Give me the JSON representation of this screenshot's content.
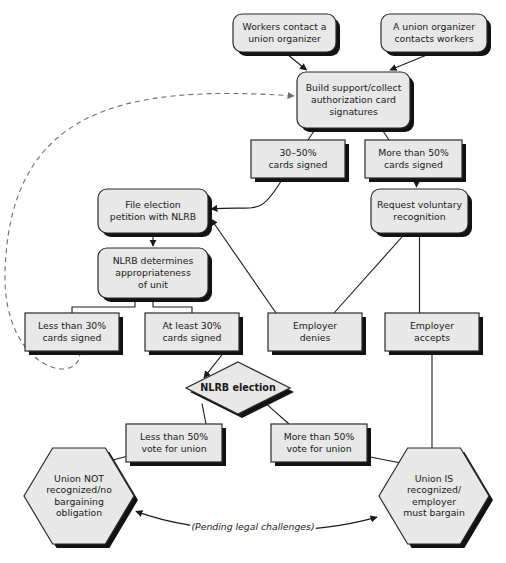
{
  "chart_data": {
    "type": "diagram",
    "title": "",
    "diagram_kind": "flowchart",
    "background": "#ffffff",
    "fill_color": "#e8e8e8",
    "stroke_color": "#2b2b2b",
    "shadow_color": "#121212",
    "nodes": [
      {
        "id": "n1",
        "label": "Workers contact a\nunion organizer",
        "shape": "rounded-rect",
        "x": 233,
        "y": 14,
        "w": 103,
        "h": 38
      },
      {
        "id": "n2",
        "label": "A union organizer\ncontacts workers",
        "shape": "rounded-rect",
        "x": 381,
        "y": 14,
        "w": 106,
        "h": 38
      },
      {
        "id": "n3",
        "label": "Build support/collect\nauthorization card\nsignatures",
        "shape": "rounded-rect",
        "x": 297,
        "y": 72,
        "w": 113,
        "h": 56
      },
      {
        "id": "n4",
        "label": "30–50%\ncards signed",
        "shape": "rect",
        "x": 251,
        "y": 140,
        "w": 94,
        "h": 38
      },
      {
        "id": "n5",
        "label": "More than 50%\ncards signed",
        "shape": "rect",
        "x": 365,
        "y": 140,
        "w": 97,
        "h": 38
      },
      {
        "id": "n6",
        "label": "Request voluntary\nrecognition",
        "shape": "rounded-rect",
        "x": 371,
        "y": 189,
        "w": 97,
        "h": 44
      },
      {
        "id": "n7",
        "label": "File election\npetition with NLRB",
        "shape": "rounded-rect",
        "x": 98,
        "y": 189,
        "w": 110,
        "h": 44
      },
      {
        "id": "n8",
        "label": "NLRB determines\nappropriateness\nof unit",
        "shape": "rounded-rect",
        "x": 98,
        "y": 248,
        "w": 110,
        "h": 50
      },
      {
        "id": "n9",
        "label": "Less than 30%\ncards signed",
        "shape": "rect",
        "x": 25,
        "y": 313,
        "w": 94,
        "h": 38
      },
      {
        "id": "n10",
        "label": "At least 30%\ncards signed",
        "shape": "rect",
        "x": 145,
        "y": 313,
        "w": 94,
        "h": 38
      },
      {
        "id": "n11",
        "label": "Employer\ndenies",
        "shape": "rect",
        "x": 268,
        "y": 313,
        "w": 94,
        "h": 38
      },
      {
        "id": "n12",
        "label": "Employer\naccepts",
        "shape": "rect",
        "x": 385,
        "y": 313,
        "w": 94,
        "h": 38
      },
      {
        "id": "n13",
        "label": "NLRB election",
        "shape": "diamond",
        "x": 186,
        "y": 362,
        "w": 104,
        "h": 52,
        "bold": true
      },
      {
        "id": "n14",
        "label": "Less than 50%\nvote for union",
        "shape": "rect",
        "x": 126,
        "y": 424,
        "w": 96,
        "h": 38
      },
      {
        "id": "n15",
        "label": "More than 50%\nvote for union",
        "shape": "rect",
        "x": 271,
        "y": 424,
        "w": 96,
        "h": 38
      },
      {
        "id": "n16",
        "label": "Union NOT\nrecognized/no\nbargaining\nobligation",
        "shape": "hexagon",
        "x": 24,
        "y": 448,
        "w": 110,
        "h": 96
      },
      {
        "id": "n17",
        "label": "Union IS\nrecognized/\nemployer\nmust bargain",
        "shape": "hexagon",
        "x": 379,
        "y": 448,
        "w": 110,
        "h": 96
      }
    ],
    "edge_labels": [
      {
        "id": "e-pending",
        "text": "(Pending legal challenges)",
        "x": 253,
        "y": 530,
        "italic": true
      }
    ],
    "edges": [
      {
        "from": "n1",
        "to": "n3",
        "style": "solid",
        "arrow": true
      },
      {
        "from": "n2",
        "to": "n3",
        "style": "solid",
        "arrow": true
      },
      {
        "from": "n3",
        "to": "n4",
        "style": "solid",
        "arrow": false
      },
      {
        "from": "n3",
        "to": "n5",
        "style": "solid",
        "arrow": false
      },
      {
        "from": "n5",
        "to": "n6",
        "style": "solid",
        "arrow": true
      },
      {
        "from": "n4",
        "to": "n7",
        "style": "solid",
        "arrow": true
      },
      {
        "from": "n7",
        "to": "n8",
        "style": "solid",
        "arrow": true
      },
      {
        "from": "n8",
        "to": "n9",
        "style": "solid",
        "arrow": false
      },
      {
        "from": "n8",
        "to": "n10",
        "style": "solid",
        "arrow": false
      },
      {
        "from": "n6",
        "to": "n11",
        "style": "solid",
        "arrow": false
      },
      {
        "from": "n6",
        "to": "n12",
        "style": "solid",
        "arrow": false
      },
      {
        "from": "n11",
        "to": "n7",
        "style": "solid",
        "arrow": true
      },
      {
        "from": "n10",
        "to": "n13",
        "style": "solid",
        "arrow": true
      },
      {
        "from": "n13",
        "to": "n14",
        "style": "solid",
        "arrow": false
      },
      {
        "from": "n13",
        "to": "n15",
        "style": "solid",
        "arrow": false
      },
      {
        "from": "n14",
        "to": "n16",
        "style": "solid",
        "arrow": true
      },
      {
        "from": "n15",
        "to": "n17",
        "style": "solid",
        "arrow": true
      },
      {
        "from": "n12",
        "to": "n17",
        "style": "solid",
        "arrow": false
      },
      {
        "from": "n9",
        "to": "n3",
        "style": "dashed",
        "arrow": true
      },
      {
        "from": "n17",
        "to": "n16",
        "style": "solid",
        "arrow": true,
        "label": "e-pending"
      }
    ]
  }
}
